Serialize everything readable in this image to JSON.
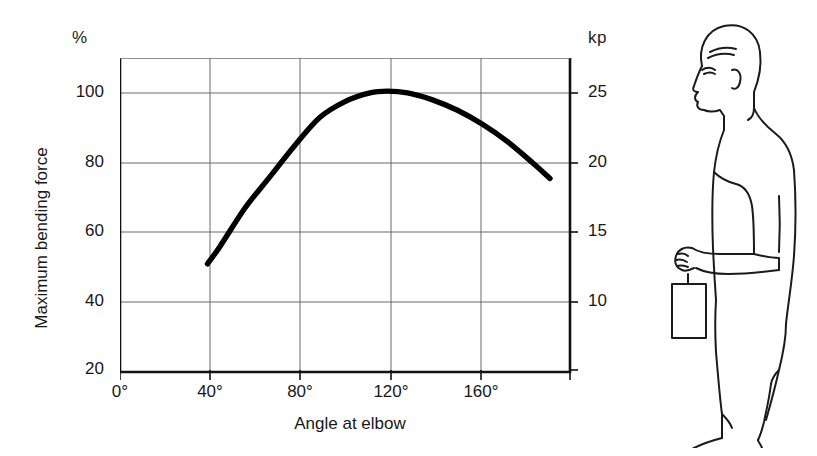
{
  "chart_data": {
    "type": "line",
    "title": "",
    "subtitle": "",
    "xlabel": "Angle at elbow",
    "ylabel": "Maximum bending force",
    "left_axis_unit": "%",
    "right_axis_unit": "kp",
    "xlim": [
      0,
      180
    ],
    "ylim": [
      20,
      110
    ],
    "right_ylim": [
      5,
      27.5
    ],
    "grid": true,
    "legend": "none",
    "xticks": [
      "0°",
      "40°",
      "80°",
      "120°",
      "160°"
    ],
    "xtick_values": [
      0,
      40,
      80,
      120,
      160
    ],
    "yticks_left": [
      "100",
      "80",
      "60",
      "40",
      "20"
    ],
    "ytick_values_left": [
      100,
      80,
      60,
      40,
      20
    ],
    "yticks_right": [
      "25",
      "20",
      "15",
      "10"
    ],
    "ytick_values_right": [
      25,
      20,
      15,
      10
    ],
    "series": [
      {
        "name": "Maximum bending force",
        "x": [
          35,
          40,
          50,
          60,
          70,
          80,
          90,
          100,
          107,
          115,
          125,
          135,
          145,
          155,
          165,
          172
        ],
        "values": [
          51,
          56,
          67,
          76,
          85,
          93,
          97.5,
          100,
          100.5,
          100,
          98,
          95,
          91,
          86,
          80,
          75.5
        ],
        "values_kp": [
          12.8,
          14.0,
          16.8,
          19.0,
          21.3,
          23.3,
          24.4,
          25.0,
          25.1,
          25.0,
          24.5,
          23.8,
          22.8,
          21.5,
          20.0,
          18.9
        ],
        "color": "#000000"
      }
    ]
  },
  "axes": {
    "unit_left": "%",
    "unit_right": "kp",
    "ylabel": "Maximum bending force",
    "xlabel": "Angle at elbow"
  },
  "illustration": {
    "name": "person-holding-weight-side-view",
    "description": "Side view line drawing of a standing person holding a weight with the forearm horizontal"
  },
  "colors": {
    "curve": "#000000",
    "frame": "#111111",
    "grid": "#6b6b6b",
    "text": "#181818",
    "background": "#ffffff"
  }
}
